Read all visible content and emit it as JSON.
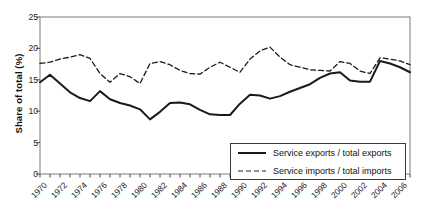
{
  "chart_data": {
    "type": "line",
    "title": "",
    "xlabel": "",
    "ylabel": "Share of total (%)",
    "ylim": [
      0,
      25
    ],
    "yticks": [
      0,
      5,
      10,
      15,
      20,
      25
    ],
    "xlim": [
      1970,
      2007
    ],
    "x": [
      1970,
      1971,
      1972,
      1973,
      1974,
      1975,
      1976,
      1977,
      1978,
      1979,
      1980,
      1981,
      1982,
      1983,
      1984,
      1985,
      1986,
      1987,
      1988,
      1989,
      1990,
      1991,
      1992,
      1993,
      1994,
      1995,
      1996,
      1997,
      1998,
      1999,
      2000,
      2001,
      2002,
      2003,
      2004,
      2005,
      2006,
      2007
    ],
    "xtick_labels": [
      "1970",
      "1972",
      "1974",
      "1976",
      "1978",
      "1980",
      "1982",
      "1984",
      "1986",
      "1988",
      "1990",
      "1992",
      "1994",
      "1996",
      "1998",
      "2000",
      "2002",
      "2004",
      "2006"
    ],
    "xtick_step_minor": 1,
    "grid": false,
    "legend_position": "bottom-right",
    "series": [
      {
        "name": "Service exports / total exports",
        "style": "solid",
        "color": "#1a1a1a",
        "values": [
          14.6,
          15.8,
          14.4,
          13.0,
          12.1,
          11.6,
          13.2,
          11.9,
          11.3,
          10.9,
          10.3,
          8.7,
          9.9,
          11.3,
          11.4,
          11.1,
          10.2,
          9.5,
          9.4,
          9.4,
          11.2,
          12.6,
          12.5,
          12.0,
          12.4,
          13.1,
          13.7,
          14.3,
          15.3,
          16.0,
          16.2,
          14.9,
          14.7,
          14.7,
          18.0,
          17.6,
          17.0,
          16.2
        ]
      },
      {
        "name": "Service imports / total imports",
        "style": "dashed",
        "color": "#1a1a1a",
        "values": [
          17.6,
          17.8,
          18.3,
          18.6,
          19.0,
          18.4,
          16.0,
          14.6,
          16.0,
          15.5,
          14.4,
          17.6,
          17.9,
          17.4,
          16.5,
          16.0,
          15.9,
          17.0,
          17.8,
          17.0,
          16.2,
          18.3,
          19.6,
          20.2,
          18.6,
          17.4,
          17.0,
          16.6,
          16.5,
          16.4,
          17.9,
          17.6,
          16.4,
          16.0,
          18.5,
          18.3,
          18.0,
          17.4
        ]
      }
    ]
  },
  "legend": {
    "items": [
      {
        "label": "Service exports / total exports",
        "style": "solid"
      },
      {
        "label": "Service imports / total imports",
        "style": "dashed"
      }
    ]
  }
}
